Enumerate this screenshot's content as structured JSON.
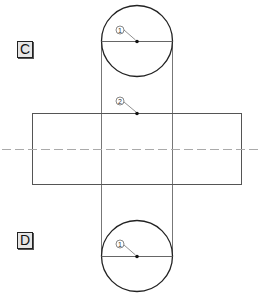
{
  "views": [
    {
      "label": "C",
      "x": 17,
      "y": 42
    },
    {
      "label": "D",
      "x": 17,
      "y": 232
    }
  ],
  "markers": [
    {
      "number": "1",
      "view": "C"
    },
    {
      "number": "2",
      "view": "development"
    },
    {
      "number": "1",
      "view": "D"
    }
  ],
  "colors": {
    "line": "#333333",
    "thin_line": "#777777",
    "center_line": "#aaaaaa",
    "label_bg": "#e6e6e6"
  }
}
